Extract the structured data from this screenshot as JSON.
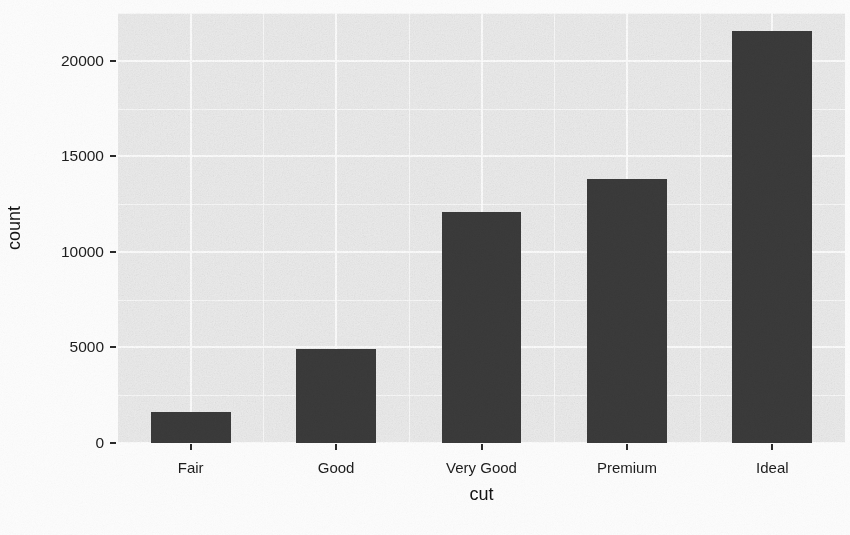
{
  "chart_data": {
    "type": "bar",
    "title": "",
    "subtitle": "",
    "xlabel": "cut",
    "ylabel": "count",
    "categories": [
      "Fair",
      "Good",
      "Very Good",
      "Premium",
      "Ideal"
    ],
    "values": [
      1610,
      4906,
      12082,
      13791,
      21551
    ],
    "series": [
      {
        "name": "count",
        "values": [
          1610,
          4906,
          12082,
          13791,
          21551
        ]
      }
    ],
    "ylim": [
      0,
      22500
    ],
    "xlim": [
      0,
      5
    ],
    "y_ticks": [
      0,
      5000,
      10000,
      15000,
      20000
    ],
    "y_tick_labels": [
      "0",
      "5000",
      "10000",
      "15000",
      "20000"
    ],
    "y_minor_ticks": [
      2500,
      7500,
      12500,
      17500,
      22500
    ],
    "x_tick_labels": [
      "Fair",
      "Good",
      "Very Good",
      "Premium",
      "Ideal"
    ],
    "grid": true,
    "grid_major_color": "#ffffff",
    "grid_minor_color": "#ffffff",
    "legend": null,
    "legend_position": "none",
    "bar_color": "#3b3b3b",
    "panel_color": "#ededed",
    "background_color": "#fdfdfd",
    "bar_width_fraction": 0.55,
    "annotations": []
  },
  "axes": {
    "y_title": "count",
    "x_title": "cut"
  }
}
